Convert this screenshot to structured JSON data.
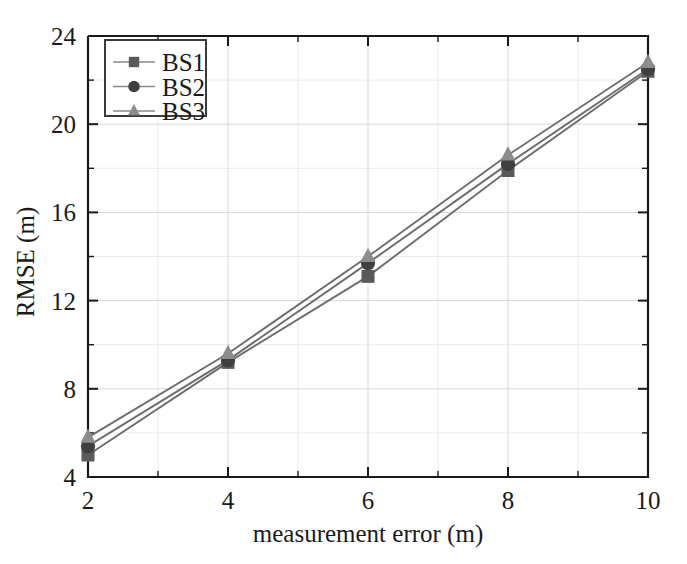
{
  "chart_data": {
    "type": "line",
    "title": "",
    "subtitle": "",
    "xlabel": "measurement error (m)",
    "ylabel": "RMSE (m)",
    "x": [
      2,
      4,
      6,
      8,
      10
    ],
    "xlim": [
      2,
      10
    ],
    "ylim": [
      4,
      24
    ],
    "x_ticks": [
      2,
      4,
      6,
      8,
      10
    ],
    "x_tick_labels": [
      "2",
      "4",
      "6",
      "8",
      "10"
    ],
    "x_minor_ticks": [
      3,
      5,
      7,
      9
    ],
    "y_ticks": [
      4,
      8,
      12,
      16,
      20,
      24
    ],
    "y_tick_labels": [
      "4",
      "8",
      "12",
      "16",
      "20",
      "24"
    ],
    "y_minor_ticks": [
      6,
      10,
      14,
      18,
      22
    ],
    "grid": true,
    "legend_position": "upper left",
    "series": [
      {
        "name": "BS1",
        "marker": "square",
        "color": "#5a5a5a",
        "line_color": "#6d6d6d",
        "values": [
          5.0,
          9.2,
          13.1,
          17.9,
          22.4
        ]
      },
      {
        "name": "BS2",
        "marker": "circle",
        "color": "#3f3f3f",
        "line_color": "#6d6d6d",
        "values": [
          5.4,
          9.3,
          13.7,
          18.2,
          22.5
        ]
      },
      {
        "name": "BS3",
        "marker": "triangle",
        "color": "#8c8c8c",
        "line_color": "#8a8a8a",
        "values": [
          5.8,
          9.6,
          14.0,
          18.6,
          22.8
        ]
      }
    ]
  },
  "legend": {
    "entries": [
      "BS1",
      "BS2",
      "BS3"
    ]
  },
  "colors": {
    "background": "#ffffff",
    "axis": "#1a1a1a",
    "grid": "#c9c9c9",
    "series_bs1": "#5a5a5a",
    "series_bs2": "#3f3f3f",
    "series_bs3": "#8c8c8c"
  }
}
